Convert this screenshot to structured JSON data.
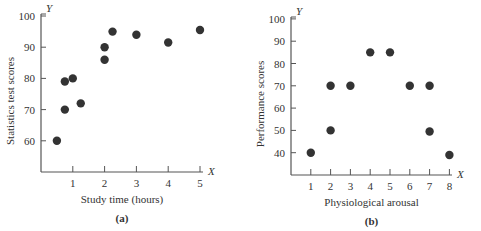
{
  "chart_data": [
    {
      "type": "scatter",
      "panel": "(a)",
      "title": "",
      "xlabel": "Study time (hours)",
      "ylabel": "Statistics test scores",
      "x_axis_letter": "X",
      "y_axis_letter": "Y",
      "xlim": [
        0,
        5
      ],
      "ylim": [
        50,
        100
      ],
      "x_ticks": [
        1,
        2,
        3,
        4,
        5
      ],
      "y_ticks": [
        60,
        70,
        80,
        90,
        100
      ],
      "grid": false,
      "legend": null,
      "points": [
        {
          "x": 0.5,
          "y": 60
        },
        {
          "x": 0.75,
          "y": 70
        },
        {
          "x": 0.75,
          "y": 79
        },
        {
          "x": 1.0,
          "y": 80
        },
        {
          "x": 1.25,
          "y": 72
        },
        {
          "x": 2.0,
          "y": 86
        },
        {
          "x": 2.0,
          "y": 90
        },
        {
          "x": 2.25,
          "y": 95
        },
        {
          "x": 3.0,
          "y": 94
        },
        {
          "x": 4.0,
          "y": 91.5
        },
        {
          "x": 5.0,
          "y": 95.5
        }
      ]
    },
    {
      "type": "scatter",
      "panel": "(b)",
      "title": "",
      "xlabel": "Physiological arousal",
      "ylabel": "Performance scores",
      "x_axis_letter": "X",
      "y_axis_letter": "Y",
      "xlim": [
        0,
        8
      ],
      "ylim": [
        30,
        100
      ],
      "x_ticks": [
        1,
        2,
        3,
        4,
        5,
        6,
        7,
        8
      ],
      "y_ticks": [
        40,
        50,
        60,
        70,
        80,
        90,
        100
      ],
      "grid": false,
      "legend": null,
      "points": [
        {
          "x": 1,
          "y": 40
        },
        {
          "x": 2,
          "y": 50
        },
        {
          "x": 2,
          "y": 70
        },
        {
          "x": 3,
          "y": 70
        },
        {
          "x": 4,
          "y": 85
        },
        {
          "x": 5,
          "y": 85
        },
        {
          "x": 6,
          "y": 70
        },
        {
          "x": 7,
          "y": 70
        },
        {
          "x": 7,
          "y": 49.5
        },
        {
          "x": 8,
          "y": 39
        }
      ]
    }
  ],
  "colors": {
    "axis": "#555555",
    "point": "#333333",
    "text": "#333333"
  }
}
